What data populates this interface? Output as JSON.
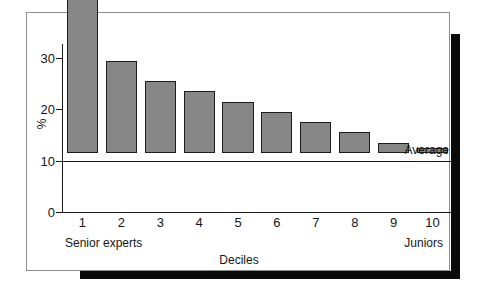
{
  "chart_data": {
    "type": "bar",
    "title": "",
    "subtitle": "",
    "xlabel": "Deciles",
    "ylabel": "%",
    "categories": [
      "1",
      "2",
      "3",
      "4",
      "5",
      "6",
      "7",
      "8",
      "9",
      "10"
    ],
    "values": [
      30,
      18,
      14,
      12,
      10,
      8,
      6,
      4,
      2,
      1
    ],
    "series": [
      {
        "name": "Share of output",
        "values": [
          30,
          18,
          14,
          12,
          10,
          8,
          6,
          4,
          2,
          1
        ]
      }
    ],
    "ylim": [
      0,
      32
    ],
    "yticks": [
      0,
      10,
      20,
      30
    ],
    "ytick_labels": [
      "0",
      "10",
      "20",
      "30"
    ],
    "xlim_note": "categorical deciles 1-10",
    "grid": false,
    "legend": false,
    "legend_position": "none",
    "annotations": [
      {
        "name": "average-reference-line",
        "label": "Average",
        "value": 10,
        "orientation": "horizontal",
        "label_position": "right-above-line"
      },
      {
        "name": "x-axis-left-endcap",
        "label": "Senior experts",
        "position": "below-axis-left"
      },
      {
        "name": "x-axis-right-endcap",
        "label": "Juniors",
        "position": "below-axis-right"
      }
    ],
    "colors": {
      "bar_fill": "#878787",
      "bar_stroke": "#1c1c1c",
      "axis": "#1a1a1a",
      "text": "#161616",
      "panel_background": "#ffffff",
      "panel_border": "#8d8d8d",
      "page_background": "#ffffff",
      "drop_shadow": "#0a0a0a"
    }
  },
  "figure": {
    "axis_labels": {
      "y_title": "%",
      "x_title": "Deciles"
    },
    "average": {
      "label": "Average"
    },
    "endcaps": {
      "left": "Senior experts",
      "right": "Juniors"
    }
  }
}
